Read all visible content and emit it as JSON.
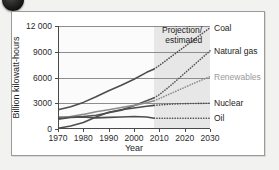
{
  "badge": {
    "name": "numbered-bullet",
    "visible": true
  },
  "title_remnant": "",
  "axes": {
    "ylabel": "Billion kilowatt-hours",
    "xlabel": "Year",
    "yticks": [
      "0",
      "3000",
      "6000",
      "9000",
      "12 000"
    ],
    "xticks": [
      "1970",
      "1980",
      "1990",
      "2000",
      "2010",
      "2020",
      "2030"
    ]
  },
  "annotation": {
    "line1": "Projection/",
    "line2": "estimated"
  },
  "colors": {
    "coal": "#4d4d4d",
    "natural_gas": "#555555",
    "renewables": "#8c8c8c",
    "nuclear": "#4d4d4d",
    "oil": "#4d4d4d",
    "grid": "#8d8d8d",
    "projection_band": "#e3e3e3",
    "frame": "#9a9a9a"
  },
  "chart_data": {
    "type": "line",
    "title": "",
    "xlabel": "Year",
    "ylabel": "Billion kilowatt-hours",
    "xlim": [
      1970,
      2030
    ],
    "ylim": [
      0,
      12000
    ],
    "grid": true,
    "legend": "right-inline-labels",
    "projection_start": 2008,
    "annotations": [
      {
        "text": "Projection/estimated",
        "x": 2016,
        "y": 12600
      }
    ],
    "x": [
      1970,
      1975,
      1980,
      1985,
      1990,
      1995,
      2000,
      2005,
      2008,
      2010,
      2015,
      2020,
      2025,
      2030
    ],
    "series": [
      {
        "name": "Coal",
        "label": "Coal",
        "style": "solid-then-dotted",
        "color": "#4d4d4d",
        "values": [
          2250,
          2600,
          3100,
          3750,
          4450,
          5100,
          5800,
          6600,
          7000,
          7400,
          8500,
          9600,
          10700,
          11800
        ]
      },
      {
        "name": "Natural gas",
        "label": "Natural gas",
        "style": "solid-then-dotted",
        "color": "#555555",
        "values": [
          1350,
          1400,
          1450,
          1600,
          1900,
          2200,
          2700,
          3300,
          3650,
          4000,
          5200,
          6500,
          7800,
          9100
        ]
      },
      {
        "name": "Renewables",
        "label": "Renewables",
        "style": "solid-then-dotted",
        "color": "#8c8c8c",
        "values": [
          1200,
          1450,
          1700,
          2000,
          2250,
          2500,
          2750,
          3050,
          3300,
          3550,
          4200,
          4850,
          5500,
          6100
        ]
      },
      {
        "name": "Nuclear",
        "label": "Nuclear",
        "style": "solid-then-dotted",
        "color": "#4d4d4d",
        "values": [
          80,
          350,
          750,
          1400,
          1950,
          2250,
          2450,
          2650,
          2750,
          2800,
          2900,
          2950,
          2980,
          3000
        ]
      },
      {
        "name": "Oil",
        "label": "Oil",
        "style": "solid-then-dotted",
        "color": "#4d4d4d",
        "values": [
          1150,
          1350,
          1400,
          1300,
          1350,
          1400,
          1450,
          1400,
          1250,
          1250,
          1250,
          1250,
          1250,
          1250
        ]
      }
    ]
  }
}
